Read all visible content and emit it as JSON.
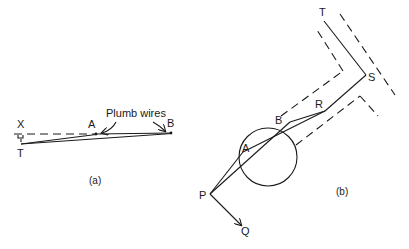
{
  "figure_a": {
    "caption": "(a)",
    "labels": {
      "X": "X",
      "T": "T",
      "A": "A",
      "B": "B",
      "plumb_wires": "Plumb wires"
    }
  },
  "figure_b": {
    "caption": "(b)",
    "labels": {
      "T": "T",
      "S": "S",
      "R": "R",
      "B": "B",
      "A": "A",
      "P": "P",
      "Q": "Q"
    }
  },
  "colors": {
    "ink": "#1a1a1a",
    "background": "#ffffff"
  }
}
